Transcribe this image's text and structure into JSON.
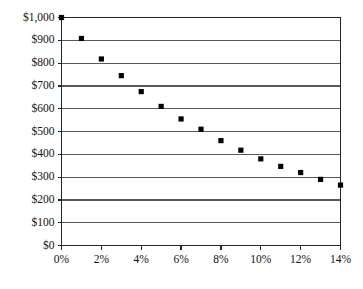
{
  "chart_data": {
    "type": "scatter",
    "title": "",
    "subtitle": "",
    "xlabel": "",
    "ylabel": "",
    "x": [
      0,
      1,
      2,
      3,
      4,
      5,
      6,
      7,
      8,
      9,
      10,
      11,
      12,
      13,
      14
    ],
    "values": [
      1000,
      908,
      818,
      745,
      675,
      610,
      555,
      510,
      460,
      418,
      380,
      347,
      320,
      290,
      265
    ],
    "series": [
      {
        "name": "",
        "x": [
          0,
          1,
          2,
          3,
          4,
          5,
          6,
          7,
          8,
          9,
          10,
          11,
          12,
          13,
          14
        ],
        "values": [
          1000,
          908,
          818,
          745,
          675,
          610,
          555,
          510,
          460,
          418,
          380,
          347,
          320,
          290,
          265
        ]
      }
    ],
    "xlim": [
      0,
      14
    ],
    "ylim": [
      0,
      1000
    ],
    "xtick_values": [
      0,
      2,
      4,
      6,
      8,
      10,
      12,
      14
    ],
    "xtick_labels": [
      "0%",
      "2%",
      "4%",
      "6%",
      "8%",
      "10%",
      "12%",
      "14%"
    ],
    "ytick_values": [
      0,
      100,
      200,
      300,
      400,
      500,
      600,
      700,
      800,
      900,
      1000
    ],
    "ytick_labels": [
      "$0",
      "$100",
      "$200",
      "$300",
      "$400",
      "$500",
      "$600",
      "$700",
      "$800",
      "$900",
      "$1,000"
    ],
    "grid": "horizontal",
    "legend": "none",
    "marker": "square",
    "marker_color": "#000000",
    "gridline_color": "#595959",
    "axis_color": "#262626",
    "background_color": "#ffffff",
    "annotations": []
  }
}
